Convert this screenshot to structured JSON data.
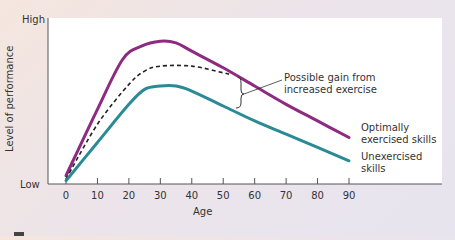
{
  "chart_data": {
    "type": "line",
    "title": "",
    "xlabel": "Age",
    "ylabel": "Level of performance",
    "xlim": [
      0,
      90
    ],
    "ylim": [
      0,
      100
    ],
    "x_ticks": [
      0,
      10,
      20,
      30,
      40,
      50,
      60,
      70,
      80,
      90
    ],
    "y_tick_labels": {
      "low": "Low",
      "high": "High"
    },
    "grid": false,
    "series": [
      {
        "name": "Optimally exercised skills",
        "color": "#8e2a7f",
        "style": "solid",
        "x": [
          0,
          10,
          18,
          24,
          30,
          35,
          40,
          50,
          60,
          70,
          80,
          90
        ],
        "values": [
          5,
          45,
          75,
          83,
          86,
          85,
          80,
          70,
          59,
          48,
          38,
          28
        ]
      },
      {
        "name": "Possible gain from increased exercise",
        "color": "#222222",
        "style": "dashed",
        "x": [
          0,
          10,
          20,
          25,
          30,
          40,
          50,
          52
        ],
        "values": [
          3,
          36,
          60,
          68,
          71,
          71,
          67,
          66
        ]
      },
      {
        "name": "Unexercised skills",
        "color": "#2a8a95",
        "style": "solid",
        "x": [
          0,
          10,
          20,
          25,
          30,
          35,
          40,
          50,
          60,
          70,
          80,
          90
        ],
        "values": [
          2,
          25,
          48,
          57,
          59,
          59,
          56,
          47,
          38,
          30,
          22,
          14
        ]
      }
    ],
    "annotations": [
      {
        "text": "Possible gain from increased exercise",
        "target_age": 55,
        "type": "bracket-callout"
      },
      {
        "text": "Optimally exercised skills",
        "target": "end of purple line"
      },
      {
        "text": "Unexercised skills",
        "target": "end of teal line"
      }
    ]
  },
  "axis": {
    "y_high": "High",
    "y_low": "Low",
    "y_title": "Level of performance",
    "x_title": "Age",
    "x_ticks": [
      "0",
      "10",
      "20",
      "30",
      "40",
      "50",
      "60",
      "70",
      "80",
      "90"
    ]
  },
  "labels": {
    "gain_line1": "Possible gain from",
    "gain_line2": "increased exercise",
    "optimal_line1": "Optimally",
    "optimal_line2": "exercised skills",
    "unexercised_line1": "Unexercised",
    "unexercised_line2": "skills"
  },
  "colors": {
    "optimal": "#8e2a7f",
    "unexercised": "#2a8a95",
    "dashed": "#222222",
    "axis": "#555555"
  }
}
